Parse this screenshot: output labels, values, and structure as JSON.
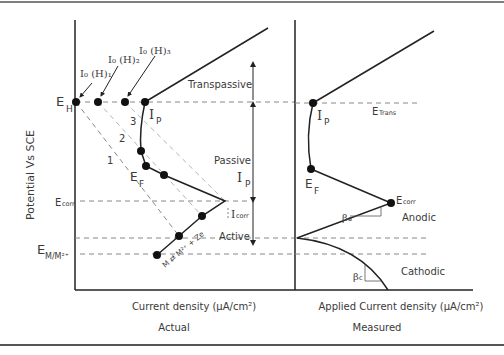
{
  "figure": {
    "y_axis_label": "Potential Vs SCE",
    "left_panel": {
      "x_axis_label": "Current density (μA/cm²)",
      "caption": "Actual",
      "labels": {
        "e_h": "E",
        "e_h_sub": "H",
        "e_corr": "E",
        "e_corr_sub": "corr",
        "e_mm": "E",
        "e_mm_sub": "M/M²⁺",
        "i0_1": "I₀ (H)₁",
        "i0_2": "I₀ (H)₂",
        "i0_3": "I₀ (H)₃",
        "ip": "I",
        "ip_sub": "P",
        "ef": "E",
        "ef_sub": "F",
        "icorr": "I",
        "icorr_sub": "corr",
        "line1": "1",
        "line2": "2",
        "line3": "3",
        "reaction": "M ⇄ M²⁺ + Ze"
      },
      "regions": {
        "transpassive": "Transpassive",
        "passive": "Passive",
        "passive_ip": "I",
        "passive_ip_sub": "P",
        "active": "Active"
      }
    },
    "right_panel": {
      "x_axis_label": "Applied Current density (μA/cm²)",
      "caption": "Measured",
      "labels": {
        "e_trans": "E",
        "e_trans_sub": "Trans",
        "ip": "I",
        "ip_sub": "P",
        "ef": "E",
        "ef_sub": "F",
        "e_corr": "E",
        "e_corr_sub": "corr",
        "beta_a": "β",
        "beta_a_sub": "a",
        "beta_c": "β",
        "beta_c_sub": "c",
        "anodic": "Anodic",
        "cathodic": "Cathodic"
      }
    },
    "colors": {
      "line": "#222222",
      "dash": "#888888",
      "dash_light": "#b5b5b5",
      "frame": "#555555"
    }
  }
}
